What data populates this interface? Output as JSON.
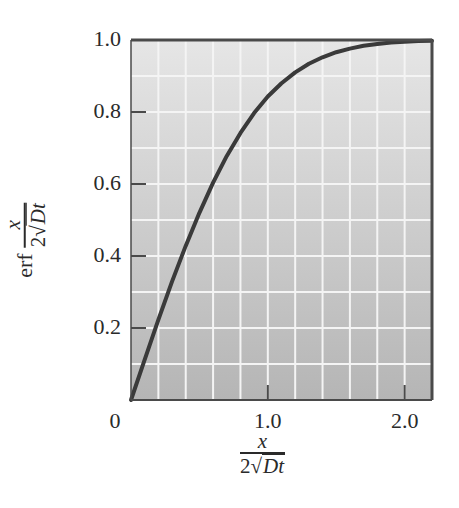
{
  "chart_data": {
    "type": "line",
    "title": "",
    "xlabel": "x / (2√(Dt))",
    "ylabel": "erf x / (2√(Dt))",
    "xlim": [
      0,
      2.2
    ],
    "ylim": [
      0,
      1.0
    ],
    "grid": true,
    "x_ticks": [
      "0",
      "1.0",
      "2.0"
    ],
    "y_ticks": [
      "0.2",
      "0.4",
      "0.6",
      "0.8",
      "1.0"
    ],
    "series": [
      {
        "name": "erf",
        "x": [
          0,
          0.1,
          0.2,
          0.3,
          0.4,
          0.5,
          0.6,
          0.7,
          0.8,
          0.9,
          1.0,
          1.1,
          1.2,
          1.3,
          1.4,
          1.5,
          1.6,
          1.7,
          1.8,
          1.9,
          2.0,
          2.1,
          2.2
        ],
        "values": [
          0,
          0.112,
          0.223,
          0.329,
          0.428,
          0.52,
          0.604,
          0.678,
          0.742,
          0.797,
          0.843,
          0.88,
          0.91,
          0.934,
          0.952,
          0.966,
          0.976,
          0.984,
          0.989,
          0.993,
          0.995,
          0.997,
          0.998
        ]
      }
    ]
  },
  "labels": {
    "y_ticks": [
      {
        "text": "1.0",
        "value": 1.0
      },
      {
        "text": "0.8",
        "value": 0.8
      },
      {
        "text": "0.6",
        "value": 0.6
      },
      {
        "text": "0.4",
        "value": 0.4
      },
      {
        "text": "0.2",
        "value": 0.2
      }
    ],
    "x_ticks": [
      {
        "text": "0",
        "value": 0
      },
      {
        "text": "1.0",
        "value": 1.0
      },
      {
        "text": "2.0",
        "value": 2.0
      }
    ],
    "ylabel_fn": "erf",
    "frac_num": "x",
    "frac_den_coef": "2",
    "frac_den_sqrt": "√",
    "frac_den_rad": "Dt"
  },
  "colors": {
    "bg_top": "#e6e6e6",
    "bg_bottom": "#b5b5b5",
    "grid": "#f4f4f4",
    "curve": "#3a3a3a",
    "frame": "#4a4a4a"
  }
}
